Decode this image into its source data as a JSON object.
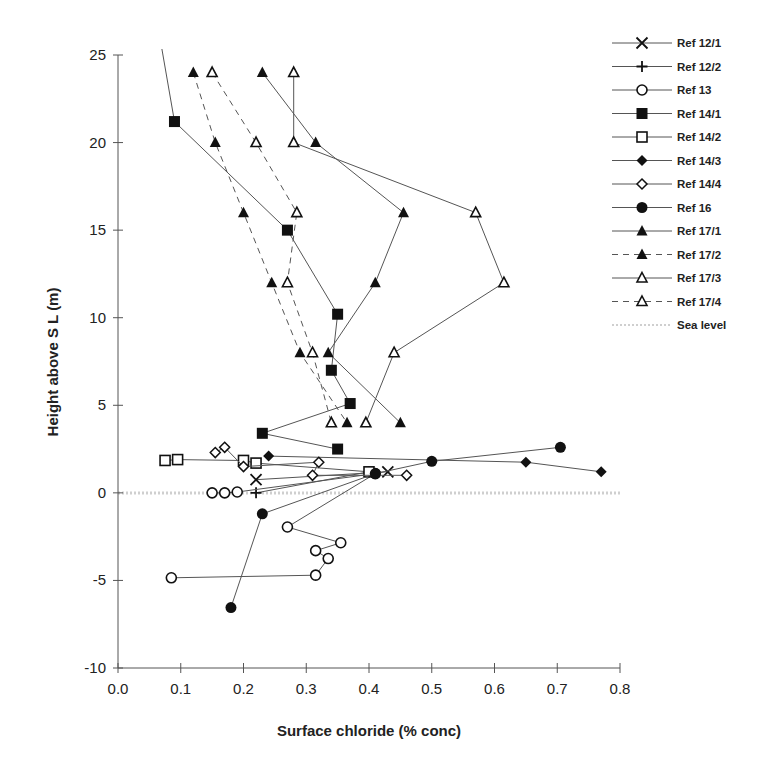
{
  "chart_data": {
    "type": "line",
    "title": "",
    "xlabel": "Surface chloride (% conc)",
    "ylabel": "Height above S L  (m)",
    "xlim": [
      0.0,
      0.8
    ],
    "ylim": [
      -10,
      25
    ],
    "x_ticks": [
      "0.0",
      "0.1",
      "0.2",
      "0.3",
      "0.4",
      "0.5",
      "0.6",
      "0.7",
      "0.8"
    ],
    "y_ticks": [
      "-10",
      "-5",
      "0",
      "5",
      "10",
      "15",
      "20",
      "25"
    ],
    "grid": false,
    "legend_position": "right",
    "series": [
      {
        "name": "Ref 12/1",
        "marker": "x",
        "line": "solid",
        "points": [
          [
            0.22,
            0.75
          ],
          [
            0.43,
            1.2
          ]
        ]
      },
      {
        "name": "Ref 12/2",
        "marker": "plus",
        "line": "solid",
        "points": [
          [
            0.22,
            0.0
          ],
          [
            0.4,
            1.2
          ]
        ]
      },
      {
        "name": "Ref 13",
        "marker": "circle-open",
        "line": "solid",
        "points": [
          [
            0.15,
            0.0
          ],
          [
            0.17,
            0.0
          ],
          [
            0.19,
            0.05
          ],
          [
            0.41,
            1.1
          ],
          [
            0.27,
            -1.95
          ],
          [
            0.355,
            -2.85
          ],
          [
            0.315,
            -3.3
          ],
          [
            0.335,
            -3.75
          ],
          [
            0.315,
            -4.7
          ],
          [
            0.085,
            -4.85
          ]
        ]
      },
      {
        "name": "Ref 14/1",
        "marker": "square-filled",
        "line": "solid",
        "points": [
          [
            0.07,
            25.5
          ],
          [
            0.09,
            21.2
          ],
          [
            0.27,
            15.0
          ],
          [
            0.35,
            10.2
          ],
          [
            0.34,
            7.0
          ],
          [
            0.37,
            5.1
          ],
          [
            0.23,
            3.4
          ],
          [
            0.35,
            2.5
          ]
        ]
      },
      {
        "name": "Ref 14/2",
        "marker": "square-open",
        "line": "solid",
        "points": [
          [
            0.075,
            1.85
          ],
          [
            0.095,
            1.9
          ],
          [
            0.2,
            1.85
          ],
          [
            0.22,
            1.7
          ],
          [
            0.4,
            1.2
          ]
        ]
      },
      {
        "name": "Ref 14/3",
        "marker": "diamond-filled",
        "line": "solid",
        "points": [
          [
            0.24,
            2.1
          ],
          [
            0.65,
            1.75
          ],
          [
            0.77,
            1.2
          ]
        ]
      },
      {
        "name": "Ref 14/4",
        "marker": "diamond-open",
        "line": "solid",
        "points": [
          [
            0.155,
            2.3
          ],
          [
            0.17,
            2.6
          ],
          [
            0.2,
            1.5
          ],
          [
            0.32,
            1.75
          ],
          [
            0.31,
            1.0
          ],
          [
            0.46,
            1.0
          ]
        ]
      },
      {
        "name": "Ref 16",
        "marker": "circle-filled",
        "line": "solid",
        "points": [
          [
            0.705,
            2.6
          ],
          [
            0.5,
            1.8
          ],
          [
            0.41,
            1.1
          ],
          [
            0.23,
            -1.2
          ],
          [
            0.18,
            -6.55
          ]
        ]
      },
      {
        "name": "Ref 17/1",
        "marker": "triangle-filled",
        "line": "solid",
        "points": [
          [
            0.23,
            24
          ],
          [
            0.315,
            20
          ],
          [
            0.455,
            16
          ],
          [
            0.41,
            12
          ],
          [
            0.335,
            8
          ],
          [
            0.45,
            4
          ]
        ]
      },
      {
        "name": "Ref 17/2",
        "marker": "triangle-filled",
        "line": "dashed",
        "points": [
          [
            0.12,
            24
          ],
          [
            0.155,
            20
          ],
          [
            0.2,
            16
          ],
          [
            0.245,
            12
          ],
          [
            0.29,
            8
          ],
          [
            0.365,
            4
          ]
        ]
      },
      {
        "name": "Ref 17/3",
        "marker": "triangle-open",
        "line": "solid",
        "points": [
          [
            0.28,
            24
          ],
          [
            0.28,
            20
          ],
          [
            0.57,
            16
          ],
          [
            0.615,
            12
          ],
          [
            0.44,
            8
          ],
          [
            0.395,
            4
          ]
        ]
      },
      {
        "name": "Ref 17/4",
        "marker": "triangle-open",
        "line": "dashed",
        "points": [
          [
            0.15,
            24
          ],
          [
            0.22,
            20
          ],
          [
            0.285,
            16
          ],
          [
            0.27,
            12
          ],
          [
            0.31,
            8
          ],
          [
            0.34,
            4
          ]
        ]
      },
      {
        "name": "Sea level",
        "marker": "none",
        "line": "dotted-gray",
        "points": [
          [
            0.0,
            0.0
          ],
          [
            0.8,
            0.0
          ]
        ]
      }
    ]
  },
  "legend": {
    "items": [
      "Ref 12/1",
      "Ref 12/2",
      "Ref 13",
      "Ref 14/1",
      "Ref 14/2",
      "Ref 14/3",
      "Ref 14/4",
      "Ref 16",
      "Ref 17/1",
      "Ref 17/2",
      "Ref 17/3",
      "Ref 17/4",
      "Sea level"
    ]
  }
}
